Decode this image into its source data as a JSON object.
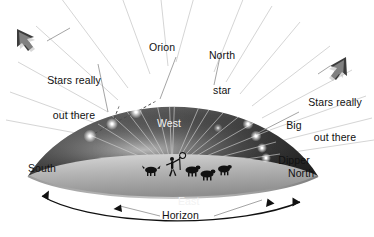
{
  "figure": {
    "kind": "celestial-dome-diagram",
    "background": "#ffffff"
  },
  "colors": {
    "ink": "#111111",
    "label_on_dome": "#f2f2f2",
    "dome_dark": "#3a3a3a",
    "dome_mid": "#6f6f6f",
    "dome_light": "#b9b9b9",
    "ground_light": "#cfcfcf",
    "ground_mid": "#9a9a9a",
    "ray": "#d8d8d8",
    "star": "#ffffff"
  },
  "labels": {
    "orion": "Orion",
    "north_star": "North\nstar",
    "north_star_line1": "North",
    "north_star_line2": "star",
    "big_dipper_line1": "Big",
    "big_dipper_line2": "Dipper",
    "stars_out_there_left": "Stars really\nout there",
    "stars_out_there_left_line1": "Stars really",
    "stars_out_there_left_line2": "out there",
    "stars_out_there_right_line1": "Stars really",
    "stars_out_there_right_line2": "out there",
    "west": "West",
    "east": "East",
    "south": "South",
    "north": "North",
    "horizon": "Horizon"
  },
  "compass": {
    "south": "South",
    "north": "North",
    "east": "East",
    "west": "West"
  },
  "constellations": [
    {
      "name": "Orion",
      "stars": 5,
      "position": "upper-left-dome"
    },
    {
      "name": "Big Dipper",
      "stars": 7,
      "position": "right-dome"
    },
    {
      "name": "North star",
      "stars": 1,
      "position": "upper-right-dome"
    }
  ],
  "annotations": [
    {
      "text": "Stars really out there",
      "arrow": "up-left",
      "side": "left"
    },
    {
      "text": "Stars really out there",
      "arrow": "up-right",
      "side": "right"
    },
    {
      "text": "Horizon",
      "arrow": "double",
      "side": "bottom"
    }
  ],
  "observer": {
    "figure": "shepherd-with-staff",
    "dogs": 1,
    "sheep": 3
  }
}
